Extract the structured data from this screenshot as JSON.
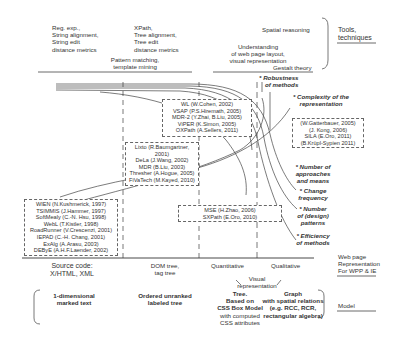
{
  "top": {
    "col1": [
      "Reg. exp.,",
      "String alignment,",
      "String edit",
      "distance metrics"
    ],
    "col2": [
      "XPath,",
      "Tree alignment,",
      "Tree edit",
      "distance metrics"
    ],
    "pattern": [
      "Pattern matching,",
      "template mining"
    ],
    "spatial": "Spatial reasoning",
    "understanding": [
      "Understanding",
      "of web page layout,",
      "visual representation"
    ],
    "gestalt": "Gestalt theory",
    "tools_label": [
      "Tools,",
      "techniques"
    ]
  },
  "criteria": {
    "robustness": [
      "* Robustness",
      "of methods"
    ],
    "complexity": [
      "* Complexity of the",
      "representation"
    ],
    "approaches": [
      "* Number of",
      "approaches",
      "and means"
    ],
    "change": [
      "* Change",
      "frequency"
    ],
    "patterns": [
      "* Number",
      "of (design)",
      "patterns"
    ],
    "efficiency": [
      "* Efficiency",
      "of methods"
    ]
  },
  "boxes": {
    "tree_tools": [
      "WL (W.Cohen, 2002)",
      "VSAP (P.S.Hiremath, 2005)",
      "MDR-2 (Y.Zhai, B.Liu, 2005)",
      "ViPER (K.Simon, 2005)",
      "OXPath (A.Sellers, 2011)"
    ],
    "dom_tools": [
      "Lixto (R.Baumgartner,",
      "2001)",
      "DeLa (J.Wang, 2002)",
      "MDR (B.Liu, 2003)",
      "Thresher (A.Hogue, 2005)",
      "FiVaTech (M.Kayed, 2010)"
    ],
    "string_tools": [
      "WIEN (N.Kushmerick, 1997)",
      "TSIMMIS (J.Hammer, 1997)",
      "SoftMealy (C.-N. Hsu, 1998)",
      "WebL (T.Kistler, 1998)",
      "RoadRunner (V.Crescenzi, 2001)",
      "IEPAD (C.-H. Chang, 2001)",
      "ExAlg (A.Arasu, 2003)",
      "DEByE (A.H.F.Laender, 2002)"
    ],
    "visual_quant": [
      "MSE (H.Zhao, 2006)",
      "SXPath (E.Oro, 2010)"
    ],
    "spatial_tools": [
      "(W.Gatterbauer, 2005)",
      "(J. Kong, 2006)",
      "SILA (E.Oro, 2011)",
      "(B.Krüpl-Sypien 2011)"
    ]
  },
  "axis": {
    "source": [
      "Source code:",
      "X/HTML, XML"
    ],
    "dom": [
      "DOM tree,",
      "tag tree"
    ],
    "quant": "Quantitative",
    "qual": "Qualitative",
    "visual": [
      "Visual",
      "representation"
    ],
    "wpp_label": [
      "Web page",
      "Representation",
      "For WPP & IE"
    ]
  },
  "model": {
    "m1": [
      "1-dimensional",
      "marked text"
    ],
    "m2": [
      "Ordered unranked",
      "labeled tree"
    ],
    "m3": [
      "Tree.",
      "Based on",
      "CSS Box Model"
    ],
    "m3b": [
      "with computed",
      "CSS attributes"
    ],
    "m4": [
      "Graph",
      "with spatial relations",
      "(e.g. RCC, RCR,",
      "rectangular algebra)"
    ],
    "label": "Model"
  }
}
